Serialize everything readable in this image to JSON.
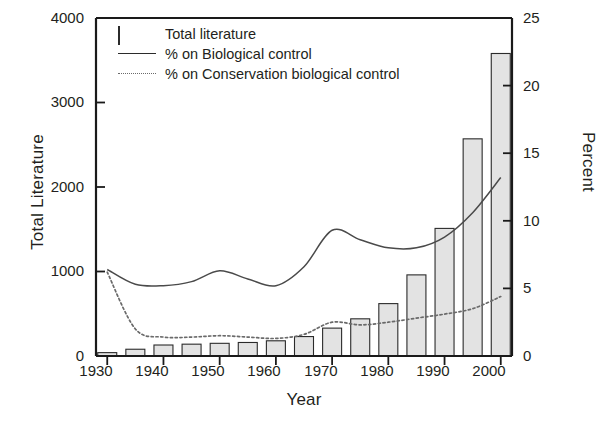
{
  "chart_data": {
    "type": "bar",
    "title": "",
    "xlabel": "Year",
    "ylabel": "Total Literature",
    "ylabel_right": "Percent",
    "xlim": [
      1928,
      2002
    ],
    "ylim": [
      0,
      4000
    ],
    "ylim_right": [
      0,
      25
    ],
    "grid": false,
    "legend_position": "top-left",
    "xticks": [
      1930,
      1940,
      1950,
      1960,
      1970,
      1980,
      1990,
      2000
    ],
    "xticklabels": [
      "1930",
      "1940",
      "1950",
      "1960",
      "1970",
      "1980",
      "1990",
      "2000"
    ],
    "yticks": [
      0,
      1000,
      2000,
      3000,
      4000
    ],
    "yticklabels": [
      "0",
      "1000",
      "2000",
      "3000",
      "4000"
    ],
    "yticks_right": [
      0,
      5,
      10,
      15,
      20,
      25
    ],
    "yticklabels_right": [
      "0",
      "5",
      "10",
      "15",
      "20",
      "25"
    ],
    "categories": [
      1930,
      1935,
      1940,
      1945,
      1950,
      1955,
      1960,
      1965,
      1970,
      1975,
      1980,
      1985,
      1990,
      1995,
      2000
    ],
    "series": [
      {
        "name": "Total literature",
        "type": "bar",
        "axis": "left",
        "unit": "publications",
        "values": [
          40,
          80,
          130,
          140,
          150,
          160,
          180,
          230,
          330,
          440,
          620,
          960,
          1510,
          2570,
          3580
        ]
      },
      {
        "name": "% on Biological control",
        "type": "line",
        "style": "solid",
        "axis": "right",
        "unit": "percent",
        "x": [
          1930,
          1935,
          1940,
          1945,
          1950,
          1955,
          1960,
          1965,
          1970,
          1975,
          1980,
          1985,
          1990,
          1995,
          2000
        ],
        "values": [
          6.4,
          5.3,
          5.2,
          5.5,
          6.3,
          5.7,
          5.2,
          6.6,
          9.3,
          8.6,
          8.0,
          8.0,
          8.8,
          10.6,
          13.2
        ]
      },
      {
        "name": "% on Conservation biological control",
        "type": "line",
        "style": "dotted",
        "axis": "right",
        "unit": "percent",
        "x": [
          1930,
          1935,
          1940,
          1945,
          1950,
          1955,
          1960,
          1965,
          1970,
          1975,
          1980,
          1985,
          1990,
          1995,
          2000
        ],
        "values": [
          6.2,
          2.0,
          1.4,
          1.4,
          1.5,
          1.4,
          1.3,
          1.6,
          2.5,
          2.3,
          2.5,
          2.8,
          3.1,
          3.5,
          4.4
        ]
      }
    ],
    "legend": [
      {
        "label": "Total literature",
        "key": "bar-swatch"
      },
      {
        "label": "% on Biological control",
        "key": "solid-line"
      },
      {
        "label": "% on Conservation biological control",
        "key": "dotted-line"
      }
    ],
    "colors": {
      "bar_fill": "#e3e3e3",
      "bar_stroke": "#2b2b2b",
      "solid_line": "#4a4a4a",
      "dotted_line": "#6a6a6a",
      "axis": "#1a1a1a",
      "text": "#231f20",
      "background": "#ffffff"
    }
  }
}
